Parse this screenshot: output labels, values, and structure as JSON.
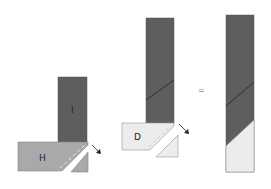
{
  "diagram": {
    "left_figure": {
      "top_block_label": "I",
      "bottom_block_label": "H"
    },
    "middle_figure": {
      "bottom_block_label": "D"
    },
    "equals_sign": "=",
    "colors": {
      "dark": "#5a5a5a",
      "medium": "#a8a8a8",
      "light": "#ebebeb",
      "outline": "#888888"
    }
  }
}
